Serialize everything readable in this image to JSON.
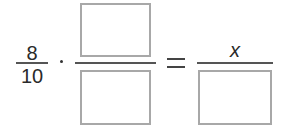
{
  "equation": {
    "left_fraction": {
      "numerator": "8",
      "denominator": "10"
    },
    "operator": "·",
    "middle_fraction": {
      "numerator": "",
      "denominator": ""
    },
    "relation": "=",
    "right_fraction": {
      "numerator": "x",
      "denominator": ""
    }
  }
}
